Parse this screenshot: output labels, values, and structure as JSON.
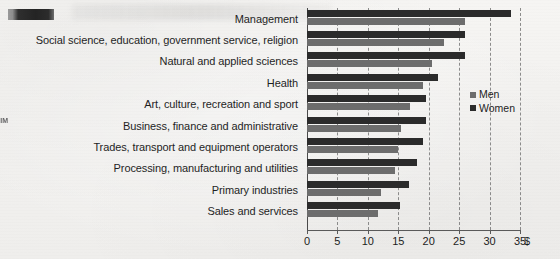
{
  "artifacts": {
    "redaction_label": "redacted-mark",
    "watermark_text": "IIM"
  },
  "legend": {
    "position": "center-right",
    "items": [
      {
        "label": "Men",
        "color": "#6d6d6d"
      },
      {
        "label": "Women",
        "color": "#2b2b2b"
      }
    ]
  },
  "axis": {
    "unit_symbol": "$",
    "ticks": [
      "0",
      "5",
      "10",
      "15",
      "20",
      "25",
      "30",
      "35"
    ]
  },
  "chart_data": {
    "type": "bar",
    "orientation": "horizontal",
    "grouped": true,
    "title": "",
    "subtitle": "",
    "xlabel": "$",
    "ylabel": "",
    "xlim": [
      0,
      35
    ],
    "xticks": [
      0,
      5,
      10,
      15,
      20,
      25,
      30,
      35
    ],
    "grid": true,
    "grid_axis": "x",
    "grid_style": "dashed",
    "legend_position": "center-right",
    "categories": [
      "Management",
      "Social science, education, government service, religion",
      "Natural and applied sciences",
      "Health",
      "Art, culture, recreation and sport",
      "Business, finance and administrative",
      "Trades, transport and equipment operators",
      "Processing, manufacturing and utilities",
      "Primary industries",
      "Sales and services"
    ],
    "series": [
      {
        "name": "Women",
        "color": "#2b2b2b",
        "values": [
          33.5,
          26.0,
          26.0,
          21.5,
          19.5,
          19.5,
          19.0,
          18.0,
          16.7,
          15.2
        ]
      },
      {
        "name": "Men",
        "color": "#6d6d6d",
        "values": [
          26.0,
          22.5,
          20.5,
          19.0,
          17.0,
          15.5,
          15.0,
          14.5,
          12.2,
          11.7
        ]
      }
    ]
  }
}
